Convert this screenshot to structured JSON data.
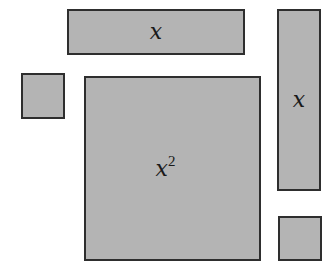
{
  "diagram": {
    "tiles": [
      {
        "id": "x-tile-horizontal",
        "label": "x",
        "exponent": null
      },
      {
        "id": "unit-tile-left",
        "label": "",
        "exponent": null
      },
      {
        "id": "x-squared-tile",
        "label": "x",
        "exponent": "2"
      },
      {
        "id": "x-tile-vertical",
        "label": "x",
        "exponent": null
      },
      {
        "id": "unit-tile-bottom-right",
        "label": "",
        "exponent": null
      }
    ],
    "colors": {
      "fill": "#b4b4b4",
      "stroke": "#2e2e2e",
      "background": "#ffffff"
    }
  }
}
